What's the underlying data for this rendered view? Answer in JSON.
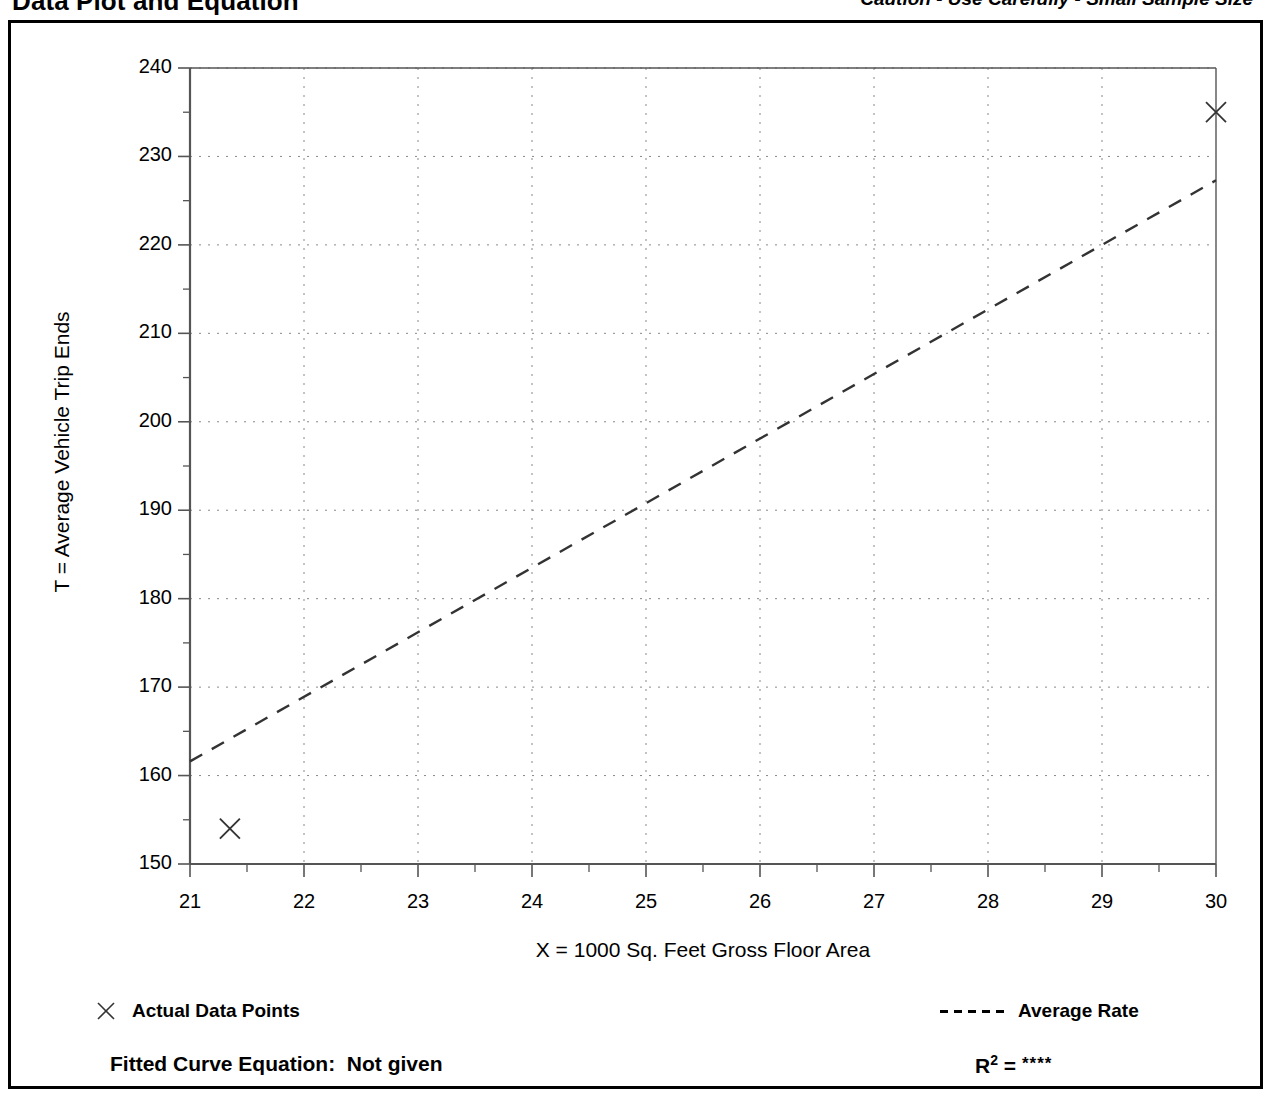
{
  "header": {
    "title": "Data Plot and Equation",
    "caution": "Caution - Use Carefully - Small Sample Size"
  },
  "legend": {
    "data_points_label": "Actual Data Points",
    "average_rate_label": "Average Rate",
    "marker_icon": "x-marker-icon",
    "line_icon": "dashed-line-icon"
  },
  "footer": {
    "equation_label": "Fitted Curve Equation:",
    "equation_value": "Not given",
    "r2_label": "R",
    "r2_exponent": "2",
    "r2_equals": "=",
    "r2_value": "****"
  },
  "chart_data": {
    "type": "scatter",
    "title": "Data Plot and Equation",
    "xlabel": "X = 1000 Sq. Feet Gross Floor Area",
    "ylabel": "T = Average Vehicle Trip Ends",
    "xlim": [
      21,
      30
    ],
    "ylim": [
      150,
      240
    ],
    "xticks": [
      21,
      22,
      23,
      24,
      25,
      26,
      27,
      28,
      29,
      30
    ],
    "xtick_labels": [
      "21",
      "22",
      "23",
      "24",
      "25",
      "26",
      "27",
      "28",
      "29",
      "30"
    ],
    "yticks": [
      150,
      160,
      170,
      180,
      190,
      200,
      210,
      220,
      230,
      240
    ],
    "ytick_labels": [
      "150",
      "160",
      "170",
      "180",
      "190",
      "200",
      "210",
      "220",
      "230",
      "240"
    ],
    "y_minor_tick_interval": 5,
    "x_minor_tick_interval": 0.5,
    "grid": true,
    "grid_style": "dotted",
    "legend_position": "below-plot",
    "series": [
      {
        "name": "Actual Data Points",
        "type": "scatter",
        "marker": "x",
        "color": "#333333",
        "points": [
          {
            "x": 21.35,
            "y": 154.0
          },
          {
            "x": 30.0,
            "y": 235.0
          }
        ]
      },
      {
        "name": "Average Rate",
        "type": "line",
        "style": "dashed",
        "color": "#333333",
        "points": [
          {
            "x": 21.0,
            "y": 161.6
          },
          {
            "x": 30.0,
            "y": 227.3
          }
        ]
      }
    ],
    "colors": {
      "axis": "#555555",
      "grid": "#888888",
      "data": "#333333",
      "frame": "#000000"
    }
  }
}
